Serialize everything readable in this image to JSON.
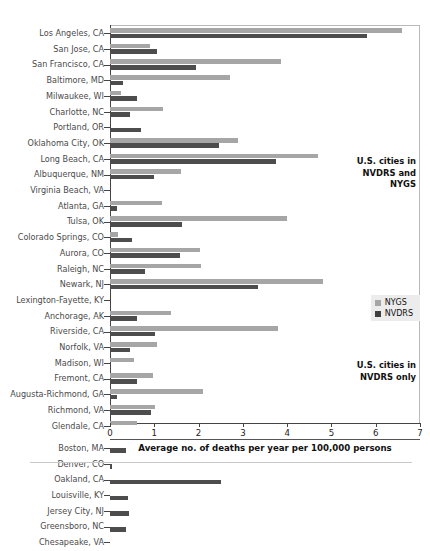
{
  "chart_data": {
    "type": "bar",
    "orientation": "horizontal",
    "title": "",
    "xlabel": "Average no. of deaths per year per 100,000 persons",
    "ylabel": "",
    "xlim": [
      0,
      7
    ],
    "xticks": [
      0,
      1,
      2,
      3,
      4,
      5,
      6,
      7
    ],
    "xtick_labels": [
      "0",
      "1",
      "2",
      "3",
      "4",
      "5",
      "6",
      "7"
    ],
    "grid": false,
    "legend": {
      "position": "right",
      "entries": [
        {
          "name": "NYGS",
          "color": "#a6a6a6"
        },
        {
          "name": "NVDRS",
          "color": "#4d4d4d"
        }
      ]
    },
    "series": [
      {
        "name": "NYGS",
        "color": "#a6a6a6"
      },
      {
        "name": "NVDRS",
        "color": "#4d4d4d"
      }
    ],
    "groups": [
      {
        "label": "U.S. cities in\nNVDRS and\nNYGS",
        "categories": [
          "Los Angeles, CA",
          "San Jose, CA",
          "San Francisco, CA",
          "Baltimore, MD",
          "Milwaukee, WI",
          "Charlotte, NC",
          "Portland, OR",
          "Oklahoma City, OK",
          "Long Beach, CA",
          "Albuquerque, NM",
          "Virginia Beach, VA",
          "Atlanta, GA",
          "Tulsa, OK",
          "Colorado Springs, CO",
          "Aurora, CO",
          "Raleigh, NC",
          "Newark, NJ",
          "Lexington-Fayette, KY",
          "Anchorage, AK",
          "Riverside, CA",
          "Norfolk, VA",
          "Madison, WI",
          "Fremont, CA",
          "Augusta-Richmond, GA",
          "Richmond, VA",
          "Glendale, CA"
        ],
        "nygs": [
          6.6,
          0.9,
          3.86,
          2.7,
          0.25,
          1.2,
          0.0,
          2.9,
          4.7,
          1.6,
          0.0,
          1.18,
          4.0,
          0.18,
          2.03,
          2.05,
          4.8,
          0.0,
          1.38,
          3.8,
          1.06,
          0.55,
          0.98,
          2.1,
          1.02,
          0.6
        ],
        "nvdrs": [
          5.8,
          1.05,
          1.95,
          0.3,
          0.62,
          0.45,
          0.7,
          2.45,
          3.75,
          1.0,
          0.0,
          0.15,
          1.62,
          0.5,
          1.58,
          0.78,
          3.35,
          0.0,
          0.6,
          1.02,
          0.45,
          0.0,
          0.6,
          0.15,
          0.93,
          0.0
        ]
      },
      {
        "label": "U.S. cities in\nNVDRS only",
        "categories": [
          "Boston, MA",
          "Denver, CO",
          "Oakland, CA",
          "Louisville, KY",
          "Jersey City, NJ",
          "Greensboro, NC",
          "Chesapeake, VA"
        ],
        "nygs": [
          0.0,
          0.0,
          0.0,
          0.0,
          0.0,
          0.0,
          0.0
        ],
        "nvdrs": [
          0.35,
          0.05,
          2.5,
          0.4,
          0.42,
          0.37,
          0.0
        ]
      }
    ]
  }
}
